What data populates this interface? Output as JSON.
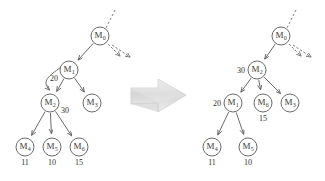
{
  "figure": {
    "background_color": "#ffffff",
    "node_stroke_color": "#5a5a5a",
    "text_color": "#2f2f2f",
    "transition_arrow": {
      "name": "transition-arrow",
      "direction": "right",
      "fill_color": "#d8d8d8"
    }
  },
  "left_tree": {
    "name": "tree-before",
    "nodes": [
      {
        "id": "root",
        "label": "M",
        "sub": "0",
        "x": 100,
        "y": 36,
        "weight": null,
        "weight_dx": 0,
        "weight_dy": 0,
        "value": null
      },
      {
        "id": "n1",
        "label": "M",
        "sub": "1",
        "x": 69,
        "y": 70,
        "weight": "20",
        "weight_dx": -15,
        "weight_dy": 11,
        "value": null
      },
      {
        "id": "n2",
        "label": "M",
        "sub": "2",
        "x": 50,
        "y": 103,
        "weight": "30",
        "weight_dx": 15,
        "weight_dy": 10,
        "value": null
      },
      {
        "id": "n3",
        "label": "M",
        "sub": "3",
        "x": 92,
        "y": 103,
        "weight": null,
        "weight_dx": 0,
        "weight_dy": 0,
        "value": null
      },
      {
        "id": "n4",
        "label": "M",
        "sub": "4",
        "x": 25,
        "y": 147,
        "weight": null,
        "weight_dx": 0,
        "weight_dy": 0,
        "value": "11"
      },
      {
        "id": "n5",
        "label": "M",
        "sub": "5",
        "x": 52,
        "y": 147,
        "weight": null,
        "weight_dx": 0,
        "weight_dy": 0,
        "value": "10"
      },
      {
        "id": "n6",
        "label": "M",
        "sub": "6",
        "x": 79,
        "y": 147,
        "weight": null,
        "weight_dx": 0,
        "weight_dy": 0,
        "value": "15"
      }
    ],
    "edges": [
      {
        "from": "root",
        "to": "n1"
      },
      {
        "from": "n1",
        "to": "n2"
      },
      {
        "from": "n1",
        "to": "n3"
      },
      {
        "from": "n2",
        "to": "n4"
      },
      {
        "from": "n2",
        "to": "n5"
      },
      {
        "from": "n2",
        "to": "n6"
      }
    ],
    "curved_edge": {
      "name": "curved-sift-arrow",
      "from": "n1",
      "to": "n2"
    },
    "incoming_dotted": {
      "name": "incoming-dotted-edge",
      "x1": 115,
      "y1": 10,
      "x2": 106,
      "y2": 28
    },
    "outgoing_dashed": [
      {
        "name": "outgoing-dashed-arrow-1",
        "x1": 108,
        "y1": 44,
        "x2": 120,
        "y2": 56
      },
      {
        "name": "outgoing-dashed-arrow-2",
        "x1": 112,
        "y1": 45,
        "x2": 130,
        "y2": 57
      }
    ]
  },
  "right_tree": {
    "name": "tree-after",
    "nodes": [
      {
        "id": "root",
        "label": "M",
        "sub": "0",
        "x": 281,
        "y": 36,
        "weight": null,
        "weight_dx": 0,
        "weight_dy": 0,
        "value": null
      },
      {
        "id": "n2",
        "label": "M",
        "sub": "2",
        "x": 257,
        "y": 70,
        "weight": "30",
        "weight_dx": -16,
        "weight_dy": 3,
        "value": null
      },
      {
        "id": "n1",
        "label": "M",
        "sub": "1",
        "x": 233,
        "y": 103,
        "weight": "20",
        "weight_dx": -16,
        "weight_dy": 3,
        "value": null
      },
      {
        "id": "n6",
        "label": "M",
        "sub": "6",
        "x": 263,
        "y": 103,
        "weight": null,
        "weight_dx": 0,
        "weight_dy": 0,
        "value": "15"
      },
      {
        "id": "n3",
        "label": "M",
        "sub": "3",
        "x": 290,
        "y": 103,
        "weight": null,
        "weight_dx": 0,
        "weight_dy": 0,
        "value": null
      },
      {
        "id": "n4",
        "label": "M",
        "sub": "4",
        "x": 212,
        "y": 147,
        "weight": null,
        "weight_dx": 0,
        "weight_dy": 0,
        "value": "11"
      },
      {
        "id": "n5",
        "label": "M",
        "sub": "5",
        "x": 248,
        "y": 147,
        "weight": null,
        "weight_dx": 0,
        "weight_dy": 0,
        "value": "10"
      }
    ],
    "edges": [
      {
        "from": "root",
        "to": "n2"
      },
      {
        "from": "n2",
        "to": "n1"
      },
      {
        "from": "n2",
        "to": "n6"
      },
      {
        "from": "n2",
        "to": "n3"
      },
      {
        "from": "n1",
        "to": "n4"
      },
      {
        "from": "n1",
        "to": "n5"
      }
    ],
    "incoming_dotted": {
      "name": "incoming-dotted-edge",
      "x1": 296,
      "y1": 10,
      "x2": 287,
      "y2": 28
    },
    "outgoing_dashed": [
      {
        "name": "outgoing-dashed-arrow-1",
        "x1": 289,
        "y1": 44,
        "x2": 301,
        "y2": 56
      },
      {
        "name": "outgoing-dashed-arrow-2",
        "x1": 293,
        "y1": 45,
        "x2": 311,
        "y2": 57
      }
    ]
  }
}
